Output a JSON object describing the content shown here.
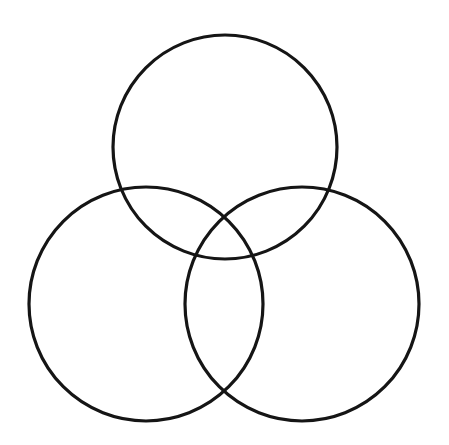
{
  "figure": {
    "background_color": "#ffffff",
    "stroke_color": "#151515",
    "stroke_width": 3.2,
    "canvas": {
      "width": 449,
      "height": 445
    },
    "caption": ""
  },
  "chart_data": {
    "type": "diagram",
    "subtype": "venn-three-circle",
    "title": "",
    "subtitle": "",
    "xlabel": "",
    "ylabel": "",
    "grid": false,
    "legend": null,
    "annotations": [],
    "axis_ranges": {
      "x": [
        0,
        449
      ],
      "y": [
        0,
        445
      ]
    },
    "shapes": [
      {
        "name": "top-circle",
        "kind": "circle",
        "cx": 225,
        "cy": 147,
        "r": 112,
        "fill": "none",
        "stroke": "#151515",
        "stroke_width": 3.2,
        "label": ""
      },
      {
        "name": "bottom-left-circle",
        "kind": "circle",
        "cx": 146,
        "cy": 304,
        "r": 117,
        "fill": "none",
        "stroke": "#151515",
        "stroke_width": 3.2,
        "label": ""
      },
      {
        "name": "bottom-right-circle",
        "kind": "circle",
        "cx": 302,
        "cy": 304,
        "r": 117,
        "fill": "none",
        "stroke": "#151515",
        "stroke_width": 3.2,
        "label": ""
      }
    ],
    "region_labels": [],
    "values": []
  }
}
